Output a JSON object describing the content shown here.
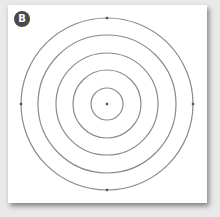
{
  "figure": {
    "label": "B",
    "colors": {
      "background": "#e9e9e9",
      "card": "#ffffff",
      "badge": "#4a4a4a",
      "ring_stroke": "#8a8a8a",
      "point": "#555555"
    },
    "center": {
      "x": 107,
      "y": 104
    },
    "rings": [
      {
        "radius": 86
      },
      {
        "radius": 69
      },
      {
        "radius": 51
      },
      {
        "radius": 34
      },
      {
        "radius": 16
      }
    ],
    "anchor_points": [
      "top",
      "right",
      "bottom",
      "left",
      "center"
    ]
  }
}
